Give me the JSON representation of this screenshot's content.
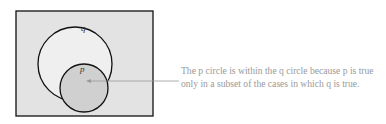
{
  "diagram": {
    "outer_label": "q",
    "inner_label": "p",
    "colors": {
      "background": "#e6e6e6",
      "outer_fill": "#efefef",
      "inner_fill": "#cfcfcf",
      "stroke": "#111111",
      "arrow": "#999999"
    }
  },
  "caption": {
    "line1": "The p circle is within the q circle because p is true",
    "line2": "only in a subset of the cases in which q is true."
  }
}
